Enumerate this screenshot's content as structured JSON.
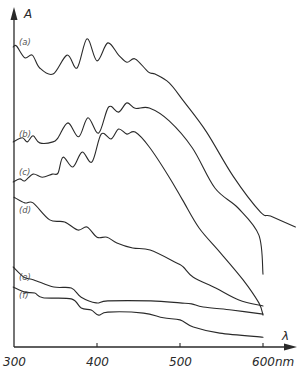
{
  "chart_data": {
    "type": "line",
    "title": "",
    "xlabel": "λ",
    "xunit": "nm",
    "ylabel": "A",
    "xlim": [
      300,
      620
    ],
    "ylim": [
      0,
      1
    ],
    "grid": false,
    "legend": "none (inline curve labels at left)",
    "xticks": [
      300,
      400,
      500,
      600
    ],
    "xtick_labels": [
      "300",
      "400",
      "500",
      "600"
    ],
    "xunit_label": "nm",
    "series": [
      {
        "name": "(a)",
        "label": "(a)",
        "x": [
          299,
          303,
          313,
          322,
          331,
          347,
          364,
          376,
          388,
          400,
          413,
          426,
          436,
          446,
          462,
          470,
          487,
          505,
          532,
          564,
          597,
          609,
          639
        ],
        "y": [
          0.885,
          0.888,
          0.853,
          0.861,
          0.823,
          0.805,
          0.861,
          0.823,
          0.909,
          0.844,
          0.897,
          0.861,
          0.84,
          0.85,
          0.811,
          0.805,
          0.779,
          0.723,
          0.634,
          0.504,
          0.398,
          0.386,
          0.354
        ]
      },
      {
        "name": "(b)",
        "label": "(b)",
        "x": [
          299,
          310,
          316,
          323,
          331,
          347,
          353,
          365,
          378,
          389,
          402,
          414,
          426,
          436,
          446,
          463,
          487,
          515,
          542,
          570,
          595,
          600
        ],
        "y": [
          0.605,
          0.617,
          0.605,
          0.623,
          0.602,
          0.605,
          0.617,
          0.661,
          0.62,
          0.676,
          0.631,
          0.708,
          0.693,
          0.72,
          0.704,
          0.705,
          0.667,
          0.587,
          0.469,
          0.41,
          0.33,
          0.215
        ]
      },
      {
        "name": "(c)",
        "label": "(c)",
        "x": [
          299,
          307,
          313,
          323,
          334,
          346,
          353,
          359,
          371,
          382,
          394,
          405,
          417,
          426,
          436,
          446,
          463,
          487,
          503,
          523,
          548,
          576,
          595,
          600
        ],
        "y": [
          0.487,
          0.496,
          0.49,
          0.51,
          0.501,
          0.51,
          0.513,
          0.56,
          0.531,
          0.575,
          0.546,
          0.628,
          0.614,
          0.643,
          0.628,
          0.634,
          0.59,
          0.501,
          0.434,
          0.351,
          0.28,
          0.198,
          0.13,
          0.094
        ]
      },
      {
        "name": "(d)",
        "label": "(d)",
        "x": [
          300,
          313,
          323,
          343,
          361,
          377,
          388,
          400,
          412,
          424,
          443,
          464,
          496,
          504,
          516,
          543,
          571,
          600
        ],
        "y": [
          0.442,
          0.425,
          0.425,
          0.375,
          0.369,
          0.345,
          0.354,
          0.324,
          0.324,
          0.307,
          0.292,
          0.286,
          0.248,
          0.236,
          0.206,
          0.174,
          0.139,
          0.121
        ]
      },
      {
        "name": "(e)",
        "label": "(e)",
        "x": [
          299,
          312,
          324,
          348,
          369,
          381,
          399,
          413,
          465,
          500,
          514,
          528,
          562,
          600
        ],
        "y": [
          0.236,
          0.206,
          0.198,
          0.177,
          0.174,
          0.147,
          0.13,
          0.136,
          0.136,
          0.13,
          0.127,
          0.118,
          0.109,
          0.097
        ]
      },
      {
        "name": "(f)",
        "label": "(f)",
        "x": [
          299,
          313,
          325,
          335,
          369,
          381,
          393,
          402,
          413,
          456,
          480,
          500,
          516,
          548,
          600
        ],
        "y": [
          0.177,
          0.162,
          0.159,
          0.145,
          0.142,
          0.115,
          0.109,
          0.094,
          0.103,
          0.1,
          0.086,
          0.08,
          0.059,
          0.041,
          0.029
        ]
      }
    ]
  }
}
